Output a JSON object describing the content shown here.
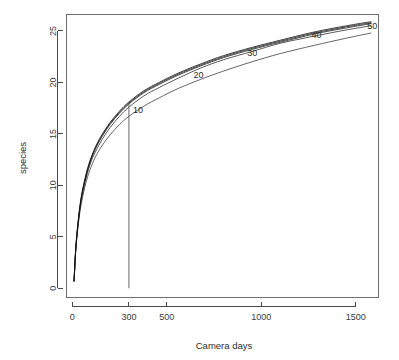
{
  "chart_data": {
    "type": "line",
    "title": "",
    "xlabel": "Camera days",
    "ylabel": "species",
    "xlim": [
      -30,
      1620
    ],
    "ylim": [
      -0.9,
      26.6
    ],
    "xticks": [
      0,
      300,
      500,
      1000,
      1500
    ],
    "xtick_labels": [
      "0",
      "300",
      "500",
      "1000",
      "1500"
    ],
    "yticks": [
      0,
      5,
      10,
      15,
      20,
      25
    ],
    "ytick_labels": [
      "0",
      "5",
      "10",
      "15",
      "20",
      "25"
    ],
    "grid": false,
    "legend": "none",
    "frame": "box",
    "annotations": [
      {
        "label": "10",
        "x": 300,
        "y": 17.3,
        "series": "curve-10"
      },
      {
        "label": "20",
        "x": 620,
        "y": 20.7,
        "series": "curve-20"
      },
      {
        "label": "30",
        "x": 905,
        "y": 22.9,
        "series": "curve-30"
      },
      {
        "label": "40",
        "x": 1245,
        "y": 24.6,
        "series": "curve-40"
      },
      {
        "label": "50",
        "x": 1540,
        "y": 25.5,
        "series": "curve-50"
      }
    ],
    "reference_lines": [
      {
        "orientation": "vertical",
        "x": 300,
        "y_from": 0,
        "y_to": 17.9,
        "label": "300 camera days"
      }
    ],
    "series": [
      {
        "name": "curve-10",
        "color": "#3c3c3c",
        "x": [
          10,
          20,
          35,
          50,
          75,
          100,
          130,
          160,
          200,
          250,
          300,
          380,
          460,
          560,
          680,
          800,
          950,
          1100,
          1280,
          1450,
          1580
        ],
        "y": [
          0.7,
          3.9,
          6.6,
          8.4,
          10.4,
          11.8,
          13.0,
          13.9,
          14.9,
          15.9,
          16.7,
          17.7,
          18.5,
          19.4,
          20.3,
          21.1,
          22.0,
          22.8,
          23.6,
          24.3,
          24.8
        ]
      },
      {
        "name": "curve-20",
        "color": "#2e2e2e",
        "x": [
          10,
          20,
          35,
          50,
          75,
          100,
          130,
          160,
          200,
          250,
          300,
          380,
          460,
          560,
          680,
          800,
          950,
          1100,
          1280,
          1450,
          1580
        ],
        "y": [
          0.7,
          4.0,
          6.8,
          8.7,
          10.8,
          12.3,
          13.5,
          14.5,
          15.6,
          16.7,
          17.6,
          18.7,
          19.5,
          20.4,
          21.4,
          22.2,
          23.0,
          23.8,
          24.5,
          25.1,
          25.5
        ]
      },
      {
        "name": "curve-30",
        "color": "#1f1f1f",
        "x": [
          10,
          20,
          35,
          50,
          75,
          100,
          130,
          160,
          200,
          250,
          300,
          380,
          460,
          560,
          680,
          800,
          950,
          1100,
          1280,
          1450,
          1580
        ],
        "y": [
          0.7,
          4.1,
          6.9,
          8.9,
          11.0,
          12.5,
          13.8,
          14.8,
          15.9,
          17.0,
          17.9,
          19.0,
          19.8,
          20.7,
          21.6,
          22.4,
          23.2,
          23.9,
          24.7,
          25.3,
          25.7
        ]
      },
      {
        "name": "curve-40",
        "color": "#141414",
        "x": [
          10,
          20,
          35,
          50,
          75,
          100,
          130,
          160,
          200,
          250,
          300,
          380,
          460,
          560,
          680,
          800,
          950,
          1100,
          1280,
          1450,
          1580
        ],
        "y": [
          0.7,
          4.1,
          7.0,
          9.0,
          11.1,
          12.6,
          13.9,
          14.9,
          16.0,
          17.1,
          18.0,
          19.1,
          19.9,
          20.8,
          21.7,
          22.5,
          23.3,
          24.0,
          24.8,
          25.4,
          25.8
        ]
      },
      {
        "name": "curve-50",
        "color": "#0d0d0d",
        "x": [
          10,
          20,
          35,
          50,
          75,
          100,
          130,
          160,
          200,
          250,
          300,
          380,
          460,
          560,
          680,
          800,
          950,
          1100,
          1280,
          1450,
          1580
        ],
        "y": [
          0.7,
          4.2,
          7.1,
          9.1,
          11.2,
          12.7,
          14.0,
          15.0,
          16.1,
          17.2,
          18.1,
          19.2,
          20.0,
          20.9,
          21.8,
          22.6,
          23.4,
          24.1,
          24.9,
          25.5,
          25.9
        ]
      }
    ]
  }
}
